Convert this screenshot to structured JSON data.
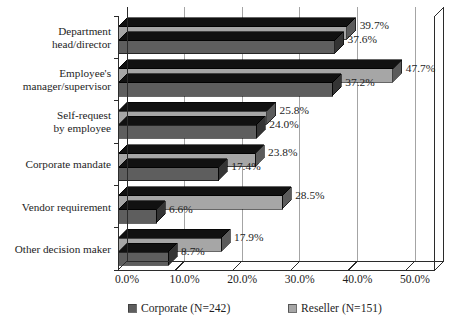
{
  "chart_data": {
    "type": "bar",
    "orientation": "horizontal",
    "title": "",
    "xlabel": "",
    "ylabel": "",
    "categories": [
      "Department head/director",
      "Employee's manager/supervisor",
      "Self-request by employee",
      "Corporate mandate",
      "Vendor requirement",
      "Other decision maker"
    ],
    "category_lines": [
      [
        "Department",
        "head/director"
      ],
      [
        "Employee's",
        "manager/supervisor"
      ],
      [
        "Self-request",
        "by employee"
      ],
      [
        "Corporate mandate"
      ],
      [
        "Vendor requirement"
      ],
      [
        "Other decision maker"
      ]
    ],
    "series": [
      {
        "name": "Reseller (N=151)",
        "color": "#a6a6a6",
        "values": [
          39.7,
          47.7,
          25.8,
          23.8,
          28.5,
          17.9
        ],
        "labels": [
          "39.7%",
          "47.7%",
          "25.8%",
          "23.8%",
          "28.5%",
          "17.9%"
        ]
      },
      {
        "name": "Corporate (N=242)",
        "color": "#5e5e5e",
        "values": [
          37.6,
          37.2,
          24.0,
          17.4,
          6.6,
          8.7
        ],
        "labels": [
          "37.6%",
          "37.2%",
          "24.0%",
          "17.4%",
          "6.6%",
          "8.7%"
        ]
      }
    ],
    "xlim": [
      0,
      55
    ],
    "xticks": [
      0,
      10,
      20,
      30,
      40,
      50
    ],
    "xtick_labels": [
      "0.0%",
      "10.0%",
      "20.0%",
      "30.0%",
      "40.0%",
      "50.0%"
    ],
    "grid": true,
    "grid_axis": "x",
    "legend": {
      "position": "bottom",
      "entries": [
        {
          "label": "Corporate (N=242)",
          "color": "#5e5e5e",
          "swatch": "legend-swatch-corporate"
        },
        {
          "label": "Reseller (N=151)",
          "color": "#a6a6a6",
          "swatch": "legend-swatch-reseller"
        }
      ]
    },
    "style": {
      "three_d": true,
      "top_face_color": "#111111",
      "background": "#ffffff",
      "axis_color": "#2b2b2b",
      "grid_color": "#9a9a9a"
    }
  }
}
